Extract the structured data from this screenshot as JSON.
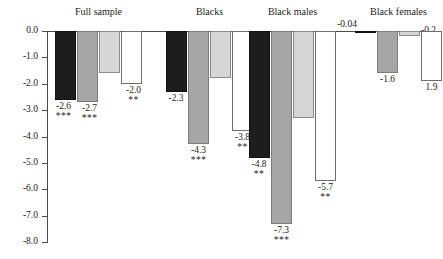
{
  "chart_data": {
    "type": "bar",
    "title": "",
    "subtitle": "",
    "xlabel": "",
    "ylabel": "",
    "ylim": [
      -8.0,
      0.0
    ],
    "grid": false,
    "legend_position": "none",
    "y_ticks": [
      "0.0",
      "-1.0",
      "-2.0",
      "-3.0",
      "-4.0",
      "-5.0",
      "-6.0",
      "-7.0",
      "-8.0"
    ],
    "y_tick_values": [
      0.0,
      -1.0,
      -2.0,
      -3.0,
      -4.0,
      -5.0,
      -6.0,
      -7.0,
      -8.0
    ],
    "categories": [
      "Full sample",
      "Blacks",
      "Black males",
      "Black females"
    ],
    "series": [
      {
        "name": "series-1",
        "color": "#1d1d1d",
        "values": [
          -2.6,
          -2.3,
          -4.8,
          -0.04
        ],
        "labels": [
          "-2.6",
          "-2.3",
          "-4.8",
          "-0.04"
        ],
        "significance": [
          "***",
          "",
          "**",
          ""
        ]
      },
      {
        "name": "series-2",
        "color": "#a6a6a6",
        "values": [
          -2.7,
          -4.3,
          -7.3,
          -1.6
        ],
        "labels": [
          "-2.7",
          "-4.3",
          "-7.3",
          "-1.6"
        ],
        "significance": [
          "***",
          "***",
          "***",
          ""
        ]
      },
      {
        "name": "series-3",
        "color": "#d6d6d6",
        "values": [
          -1.6,
          -1.8,
          -3.3,
          -0.2
        ],
        "labels": [
          "-1.6",
          "-1.8",
          "-3.3",
          "-0.2"
        ],
        "significance": [
          "",
          "",
          "",
          ""
        ]
      },
      {
        "name": "series-4",
        "color": "#ffffff",
        "values": [
          -2.0,
          -3.8,
          -5.7,
          -1.9
        ],
        "labels": [
          "-2.0",
          "-3.8",
          "-5.7",
          "1.9"
        ],
        "significance": [
          "**",
          "**",
          "**",
          ""
        ]
      }
    ]
  },
  "groups": [
    {
      "title": "Full sample"
    },
    {
      "title": "Blacks"
    },
    {
      "title": "Black males"
    },
    {
      "title": "Black females"
    }
  ]
}
